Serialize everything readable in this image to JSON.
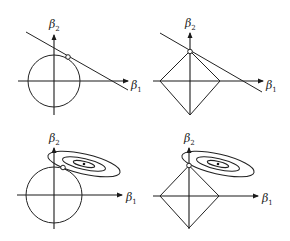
{
  "figure": {
    "axis_labels": {
      "x": "β",
      "x_sub": "1",
      "y": "β",
      "y_sub": "2"
    },
    "panels": [
      {
        "id": "top-left",
        "constraint": "circle",
        "objective": "line",
        "tangent_point_marker": "hollow-circle"
      },
      {
        "id": "top-right",
        "constraint": "diamond",
        "objective": "line",
        "tangent_point_marker": "hollow-circle-at-vertex"
      },
      {
        "id": "bottom-left",
        "constraint": "circle",
        "objective": "ellipses",
        "tangent_point_marker": "hollow-circle"
      },
      {
        "id": "bottom-right",
        "constraint": "diamond",
        "objective": "ellipses",
        "tangent_point_marker": "hollow-circle-at-vertex"
      }
    ],
    "colors": {
      "stroke": "#222222",
      "background": "#ffffff"
    }
  }
}
